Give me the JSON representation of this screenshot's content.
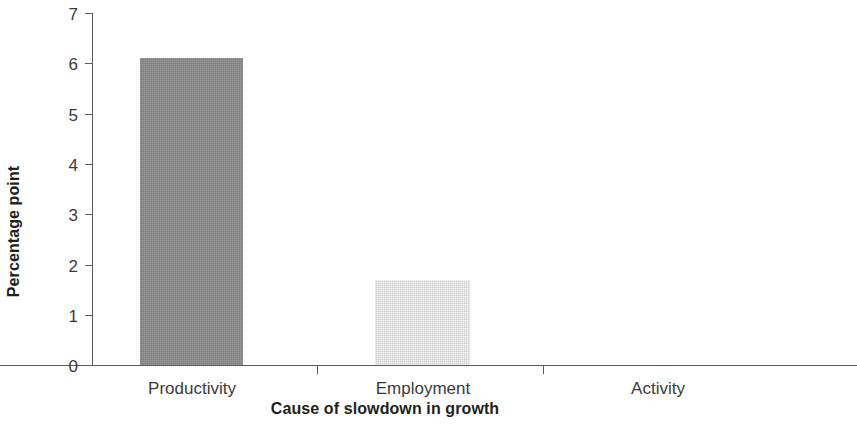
{
  "chart_data": {
    "type": "bar",
    "title": "",
    "subtitle": "",
    "xlabel": "Cause of slowdown in growth",
    "ylabel": "Percentage point",
    "categories": [
      "Productivity",
      "Employment",
      "Activity"
    ],
    "values": [
      6.1,
      1.7,
      0
    ],
    "series": [
      {
        "name": "Contribution to slowdown",
        "values": [
          6.1,
          1.7,
          0
        ]
      }
    ],
    "ylim": [
      0,
      7
    ],
    "ytick_labels": [
      "0",
      "1",
      "2",
      "3",
      "4",
      "5",
      "6",
      "7"
    ],
    "ytick_values": [
      0,
      1,
      2,
      3,
      4,
      5,
      6,
      7
    ],
    "grid": false,
    "legend": false,
    "legend_position": "none",
    "bar_colors": [
      "#8a8a8a",
      "#dedede",
      "#dedede"
    ],
    "axis_color": "#595959",
    "text_color": "#231f20",
    "background": "#ffffff"
  }
}
